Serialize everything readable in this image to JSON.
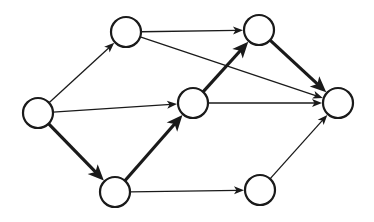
{
  "diagram": {
    "type": "directed-graph",
    "background": "#ffffff",
    "stroke_color": "#1a1a1a",
    "node_fill": "#ffffff",
    "node_radius": 15,
    "nodes": [
      {
        "id": "A",
        "x": 38,
        "y": 113
      },
      {
        "id": "B",
        "x": 126,
        "y": 32
      },
      {
        "id": "C",
        "x": 259,
        "y": 30
      },
      {
        "id": "D",
        "x": 193,
        "y": 103
      },
      {
        "id": "E",
        "x": 338,
        "y": 103
      },
      {
        "id": "F",
        "x": 115,
        "y": 192
      },
      {
        "id": "G",
        "x": 260,
        "y": 190
      }
    ],
    "edges": [
      {
        "from": "A",
        "to": "B",
        "bold": false
      },
      {
        "from": "A",
        "to": "D",
        "bold": false
      },
      {
        "from": "A",
        "to": "F",
        "bold": true
      },
      {
        "from": "B",
        "to": "C",
        "bold": false
      },
      {
        "from": "B",
        "to": "E",
        "bold": false
      },
      {
        "from": "F",
        "to": "D",
        "bold": true
      },
      {
        "from": "F",
        "to": "G",
        "bold": false
      },
      {
        "from": "D",
        "to": "C",
        "bold": true
      },
      {
        "from": "D",
        "to": "E",
        "bold": false
      },
      {
        "from": "C",
        "to": "E",
        "bold": true
      },
      {
        "from": "G",
        "to": "E",
        "bold": false
      }
    ]
  }
}
